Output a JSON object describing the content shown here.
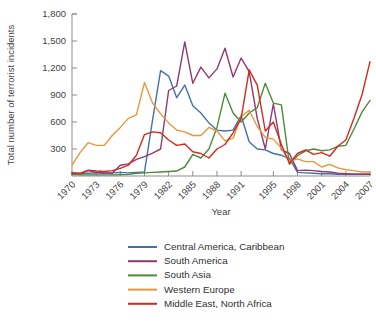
{
  "chart_data": {
    "type": "line",
    "title": "",
    "xlabel": "Year",
    "ylabel": "Total number of terrorist incidents",
    "xlim": [
      1970,
      2007
    ],
    "ylim": [
      0,
      1800
    ],
    "ytick_labels": [
      "1,800",
      "1,500",
      "1,200",
      "900",
      "600",
      "300"
    ],
    "ytick_values": [
      1800,
      1500,
      1200,
      900,
      600,
      300
    ],
    "xtick_labels": [
      "1970",
      "1973",
      "1976",
      "1979",
      "1982",
      "1985",
      "1988",
      "1991",
      "1995",
      "1998",
      "2001",
      "2004",
      "2007"
    ],
    "xtick_values": [
      1970,
      1973,
      1976,
      1979,
      1982,
      1985,
      1988,
      1991,
      1995,
      1998,
      2001,
      2004,
      2007
    ],
    "grid": false,
    "legend_position": "bottom",
    "x": [
      1970,
      1971,
      1972,
      1973,
      1974,
      1975,
      1976,
      1977,
      1978,
      1979,
      1980,
      1981,
      1982,
      1983,
      1984,
      1985,
      1986,
      1987,
      1988,
      1989,
      1990,
      1991,
      1992,
      1993,
      1994,
      1995,
      1996,
      1997,
      1998,
      1999,
      2000,
      2001,
      2002,
      2003,
      2004,
      2005,
      2006,
      2007
    ],
    "series": [
      {
        "name": "Central America, Caribbean",
        "color": "#4472a8",
        "values": [
          30,
          25,
          30,
          35,
          30,
          35,
          40,
          35,
          40,
          45,
          620,
          1170,
          1110,
          870,
          1010,
          780,
          700,
          590,
          510,
          500,
          510,
          670,
          380,
          300,
          290,
          250,
          230,
          195,
          40,
          35,
          30,
          25,
          25,
          20,
          20,
          20,
          20,
          20
        ]
      },
      {
        "name": "South America",
        "color": "#8e3a6e",
        "values": [
          30,
          25,
          60,
          40,
          35,
          30,
          120,
          135,
          185,
          215,
          255,
          300,
          950,
          1000,
          1490,
          1030,
          1210,
          1090,
          1190,
          1420,
          1100,
          1310,
          1160,
          640,
          300,
          800,
          290,
          250,
          60,
          65,
          60,
          50,
          45,
          30,
          25,
          20,
          20,
          20
        ]
      },
      {
        "name": "South Asia",
        "color": "#4e8a3a",
        "values": [
          15,
          12,
          12,
          12,
          12,
          12,
          15,
          18,
          30,
          35,
          40,
          45,
          50,
          55,
          100,
          240,
          200,
          300,
          540,
          920,
          700,
          600,
          700,
          760,
          1030,
          810,
          790,
          130,
          225,
          280,
          300,
          280,
          290,
          330,
          340,
          520,
          710,
          840
        ]
      },
      {
        "name": "Western Europe",
        "color": "#e8973a",
        "values": [
          120,
          260,
          370,
          340,
          340,
          450,
          540,
          640,
          680,
          1040,
          810,
          690,
          590,
          510,
          490,
          450,
          450,
          540,
          500,
          390,
          420,
          660,
          730,
          550,
          430,
          410,
          310,
          160,
          190,
          160,
          160,
          100,
          130,
          90,
          70,
          60,
          45,
          45
        ]
      },
      {
        "name": "Middle East, North Africa",
        "color": "#d42a1e",
        "values": [
          35,
          30,
          65,
          55,
          50,
          60,
          85,
          120,
          230,
          460,
          490,
          480,
          400,
          340,
          355,
          270,
          250,
          200,
          300,
          350,
          480,
          640,
          1180,
          1010,
          500,
          600,
          350,
          140,
          250,
          290,
          240,
          260,
          220,
          330,
          400,
          640,
          900,
          1270
        ]
      }
    ]
  },
  "legend": {
    "items": [
      {
        "label": "Central America, Caribbean"
      },
      {
        "label": "South America"
      },
      {
        "label": "South Asia"
      },
      {
        "label": "Western Europe"
      },
      {
        "label": "Middle East, North Africa"
      }
    ]
  }
}
